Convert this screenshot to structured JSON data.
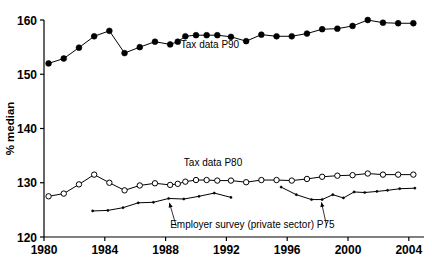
{
  "chart_data": {
    "type": "line",
    "title": "",
    "xlabel": "",
    "ylabel": "% median",
    "xlim": [
      1980,
      2005
    ],
    "ylim": [
      120,
      160
    ],
    "grid": false,
    "legend_position": "inline-annotations",
    "x_ticks": [
      "1980",
      "1984",
      "1988",
      "1992",
      "1996",
      "2000",
      "2004"
    ],
    "x_tick_values": [
      1980,
      1984,
      1988,
      1992,
      1996,
      2000,
      2004
    ],
    "y_ticks": [
      "120",
      "130",
      "140",
      "150",
      "160"
    ],
    "y_tick_values": [
      120,
      130,
      140,
      150,
      160
    ],
    "series": [
      {
        "name": "Tax data P90",
        "marker": "filled-circle",
        "x": [
          1980.3,
          1981.3,
          1982.3,
          1983.3,
          1984.3,
          1985.3,
          1986.3,
          1987.3,
          1988.3,
          1988.8,
          1989.3,
          1990.0,
          1990.7,
          1991.4,
          1992.3,
          1993.3,
          1994.3,
          1995.3,
          1996.3,
          1997.3,
          1998.3,
          1999.3,
          2000.3,
          2001.3,
          2002.3,
          2003.3,
          2004.3
        ],
        "values": [
          152.0,
          152.9,
          154.9,
          157.0,
          158.0,
          153.9,
          155.0,
          156.0,
          155.5,
          156.0,
          157.0,
          157.2,
          157.2,
          157.2,
          156.9,
          156.1,
          157.3,
          157.0,
          157.0,
          157.5,
          158.3,
          158.4,
          158.9,
          160.0,
          159.5,
          159.4,
          159.4
        ]
      },
      {
        "name": "Tax data P80",
        "marker": "open-circle",
        "x": [
          1980.3,
          1981.3,
          1982.3,
          1983.3,
          1984.3,
          1985.3,
          1986.3,
          1987.3,
          1988.3,
          1988.8,
          1989.3,
          1990.0,
          1990.7,
          1991.4,
          1992.3,
          1993.3,
          1994.3,
          1995.3,
          1996.3,
          1997.3,
          1998.3,
          1999.3,
          2000.3,
          2001.3,
          2002.3,
          2003.3,
          2004.3
        ],
        "values": [
          127.5,
          128.0,
          129.7,
          131.5,
          130.0,
          128.6,
          129.5,
          129.9,
          129.6,
          129.8,
          130.2,
          130.5,
          130.5,
          130.4,
          130.4,
          130.1,
          130.5,
          130.5,
          130.4,
          130.7,
          131.1,
          131.3,
          131.4,
          131.7,
          131.5,
          131.5,
          131.5
        ]
      },
      {
        "name": "Employer survey (private sector) P75",
        "marker": "small-dot",
        "segments": [
          {
            "x": [
              1983.2,
              1984.2,
              1985.2,
              1986.2,
              1987.2,
              1988.2,
              1989.2,
              1990.2,
              1991.2,
              1992.3
            ],
            "values": [
              124.8,
              124.9,
              125.4,
              126.3,
              126.4,
              127.1,
              127.0,
              127.5,
              128.1,
              127.3
            ]
          },
          {
            "x": [
              1995.6,
              1996.6,
              1997.6,
              1998.3,
              1999.0,
              1999.7,
              2000.4,
              2001.1,
              2001.9,
              2002.6,
              2003.4,
              2004.4
            ],
            "values": [
              129.2,
              127.8,
              126.9,
              126.9,
              127.8,
              127.2,
              128.3,
              128.2,
              128.4,
              128.6,
              128.9,
              129.0
            ]
          }
        ]
      }
    ],
    "annotations": [
      {
        "text": "Tax data P90",
        "x": 1989.0,
        "y": 154.9,
        "anchor": "start"
      },
      {
        "text": "Tax data P80",
        "x": 1989.2,
        "y": 133.1,
        "anchor": "start"
      },
      {
        "text": "Employer survey (private sector) P75",
        "x": 1988.3,
        "y": 121.6,
        "anchor": "start"
      }
    ]
  }
}
